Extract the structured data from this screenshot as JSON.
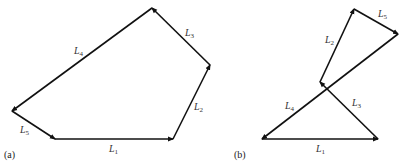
{
  "diagram_a": {
    "caption": "(a)",
    "links": [
      {
        "id": "L1",
        "base": "L",
        "sub": "1"
      },
      {
        "id": "L2",
        "base": "L",
        "sub": "2"
      },
      {
        "id": "L3",
        "base": "L",
        "sub": "3"
      },
      {
        "id": "L4",
        "base": "L",
        "sub": "4"
      },
      {
        "id": "L5",
        "base": "L",
        "sub": "5"
      }
    ]
  },
  "diagram_b": {
    "caption": "(b)",
    "links": [
      {
        "id": "L1",
        "base": "L",
        "sub": "1"
      },
      {
        "id": "L2",
        "base": "L",
        "sub": "2"
      },
      {
        "id": "L3",
        "base": "L",
        "sub": "3"
      },
      {
        "id": "L4",
        "base": "L",
        "sub": "4"
      },
      {
        "id": "L5",
        "base": "L",
        "sub": "5"
      }
    ]
  },
  "colors": {
    "stroke": "#111111",
    "label": "#333333"
  }
}
